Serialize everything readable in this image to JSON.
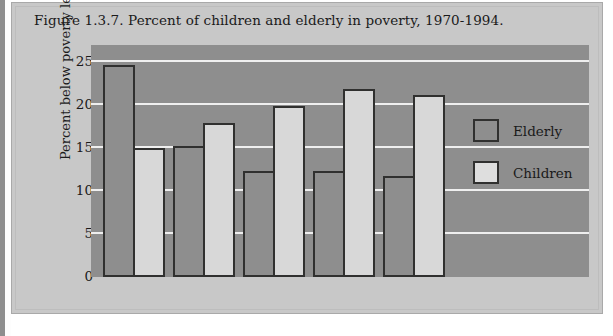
{
  "figure": {
    "title": "Figure 1.3.7. Percent of children and elderly in poverty, 1970-1994."
  },
  "chart_data": {
    "type": "bar",
    "title": "Figure 1.3.7. Percent of children and elderly in poverty, 1970-1994.",
    "xlabel": "",
    "ylabel": "Percent below poverty level",
    "categories": [
      "1970",
      "1980",
      "1990",
      "1993",
      "1994"
    ],
    "series": [
      {
        "name": "Elderly",
        "color": "#8e8e8e",
        "values": [
          24.7,
          15.2,
          12.3,
          12.3,
          11.8
        ]
      },
      {
        "name": "Children",
        "color": "#d8d8d8",
        "values": [
          15.0,
          17.9,
          19.9,
          21.9,
          21.2
        ]
      }
    ],
    "ylim": [
      0,
      27
    ],
    "yticks": [
      0,
      5,
      10,
      15,
      20,
      25
    ],
    "ytick_labels": [
      "0",
      "5",
      "10",
      "15",
      "20",
      "25"
    ],
    "grid": true,
    "legend_position": "right-center",
    "legend": [
      "Elderly",
      "Children"
    ],
    "plot_background": "#8e8e8e",
    "gridline_color": "#efefef",
    "panel_background": "#c8c8c8"
  }
}
